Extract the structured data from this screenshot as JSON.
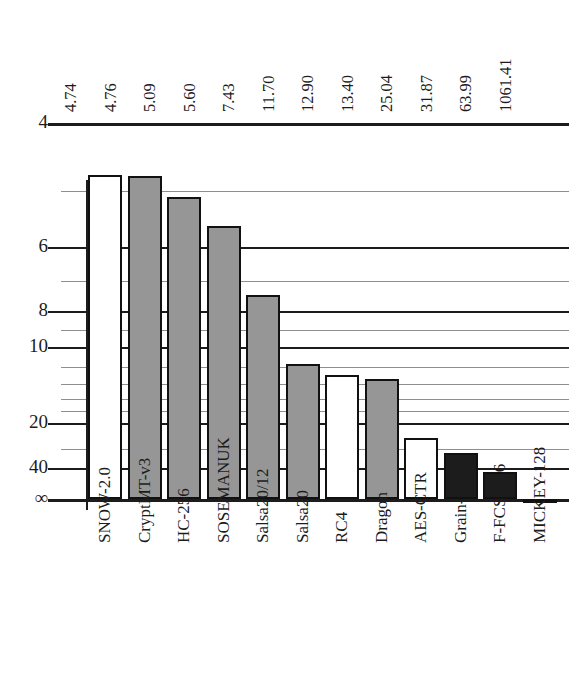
{
  "chart_data": {
    "type": "bar",
    "title": "",
    "subtitle": "",
    "xlabel": "",
    "ylabel": "",
    "orientation": "vertical",
    "axis_note": "y-axis is reversed logarithmic (cycles/byte); smaller is better, baseline is infinity",
    "grid": true,
    "legend_position": "none",
    "ylim": [
      4,
      "Infinity"
    ],
    "y_tick_labels": [
      "4",
      "6",
      "8",
      "10",
      "20",
      "40",
      "∞"
    ],
    "y_tick_values": [
      4,
      6,
      8,
      10,
      20,
      40,
      100000
    ],
    "y_minor_tick_values": [
      5,
      7,
      9,
      12,
      14,
      16,
      18,
      30
    ],
    "categories": [
      "SNOW-2.0",
      "CryptMT-v3",
      "HC-256",
      "SOSEMANUK",
      "Salsa20/12",
      "Salsa20",
      "RC4",
      "Dragon",
      "AES-CTR",
      "Grain-128",
      "F-FCSR-16",
      "MICKEY-128"
    ],
    "values": [
      4.74,
      4.76,
      5.09,
      5.6,
      7.43,
      11.7,
      12.9,
      13.4,
      25.04,
      31.87,
      63.99,
      1061.41
    ],
    "value_labels": [
      "4.74",
      "4.76",
      "5.09",
      "5.60",
      "7.43",
      "11.70",
      "12.90",
      "13.40",
      "25.04",
      "31.87",
      "63.99",
      "1061.41"
    ],
    "bar_styles": [
      "white",
      "gray",
      "gray",
      "gray",
      "gray",
      "gray",
      "white",
      "gray",
      "white",
      "black",
      "black",
      "black"
    ],
    "colors": {
      "white_fill": "#ffffff",
      "gray_fill": "#969696",
      "black_fill": "#1c1c1c",
      "bar_outline": "#111111",
      "major_gridline": "#1c1c1c",
      "minor_gridline": "#8e8e8e",
      "text": "#1c1c1c",
      "background": "#ffffff"
    }
  },
  "caption": ""
}
